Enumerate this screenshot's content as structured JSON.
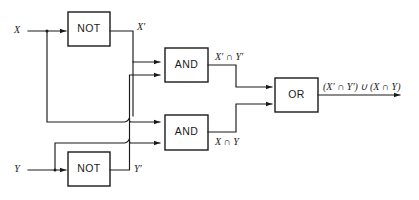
{
  "figure": {
    "name": "logic-circuit-xnor",
    "background_color": "#ffffff",
    "line_color": "#1a1a1a",
    "width": 419,
    "height": 200
  },
  "inputs": [
    {
      "id": "x",
      "label": "X"
    },
    {
      "id": "y",
      "label": "Y"
    }
  ],
  "gates": [
    {
      "id": "not-x",
      "type": "NOT",
      "label": "NOT"
    },
    {
      "id": "not-y",
      "type": "NOT",
      "label": "NOT"
    },
    {
      "id": "and-top",
      "type": "AND",
      "label": "AND"
    },
    {
      "id": "and-bottom",
      "type": "AND",
      "label": "AND"
    },
    {
      "id": "or",
      "type": "OR",
      "label": "OR"
    }
  ],
  "signals": [
    {
      "id": "x-not-out",
      "label": "X′"
    },
    {
      "id": "y-not-out",
      "label": "Y′"
    },
    {
      "id": "and-top-out",
      "label": "X′ ∩ Y′"
    },
    {
      "id": "and-bottom-out",
      "label": "X ∩ Y"
    }
  ],
  "output": {
    "id": "or-out",
    "label": "(X′ ∩ Y′) ∪ (X ∩ Y)"
  }
}
